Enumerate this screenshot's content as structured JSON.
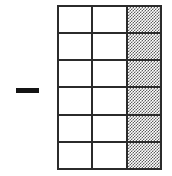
{
  "figure": {
    "background_color": "#ffffff",
    "operator": {
      "name": "minus-sign",
      "symbol": "−",
      "label": "minus",
      "color": "#141414"
    },
    "grid": {
      "columns": 3,
      "rows": 6,
      "total_cells": 18,
      "shaded_cells": 6,
      "unshaded_cells": 12,
      "shaded_column_index": 3,
      "line_color": "#2b2b2b",
      "shaded_fill_color": "#5e5e5e",
      "unshaded_fill_color": "#ffffff",
      "cells": [
        [
          {
            "label": "r1c1",
            "shaded": false
          },
          {
            "label": "r1c2",
            "shaded": false
          },
          {
            "label": "r1c3",
            "shaded": true
          }
        ],
        [
          {
            "label": "r2c1",
            "shaded": false
          },
          {
            "label": "r2c2",
            "shaded": false
          },
          {
            "label": "r2c3",
            "shaded": true
          }
        ],
        [
          {
            "label": "r3c1",
            "shaded": false
          },
          {
            "label": "r3c2",
            "shaded": false
          },
          {
            "label": "r3c3",
            "shaded": true
          }
        ],
        [
          {
            "label": "r4c1",
            "shaded": false
          },
          {
            "label": "r4c2",
            "shaded": false
          },
          {
            "label": "r4c3",
            "shaded": true
          }
        ],
        [
          {
            "label": "r5c1",
            "shaded": false
          },
          {
            "label": "r5c2",
            "shaded": false
          },
          {
            "label": "r5c3",
            "shaded": true
          }
        ],
        [
          {
            "label": "r6c1",
            "shaded": false
          },
          {
            "label": "r6c2",
            "shaded": false
          },
          {
            "label": "r6c3",
            "shaded": true
          }
        ]
      ]
    }
  }
}
